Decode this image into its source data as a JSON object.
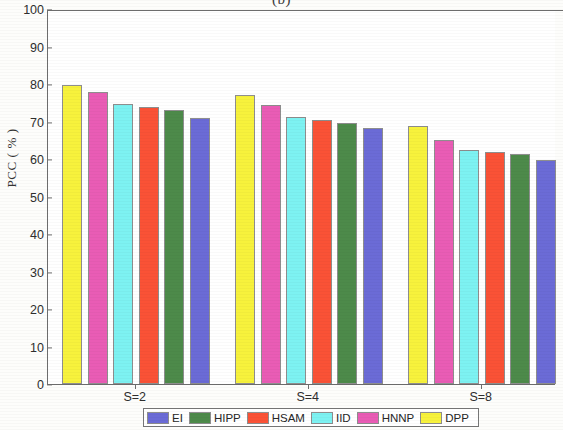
{
  "caption": "(b)",
  "chart_data": {
    "type": "bar",
    "title": "(b)",
    "xlabel": "",
    "ylabel": "PCC ( % )",
    "categories": [
      "S=2",
      "S=4",
      "S=8"
    ],
    "ylim": [
      0,
      100
    ],
    "ytick_step": 10,
    "yticks": [
      "100",
      "90",
      "80",
      "70",
      "60",
      "50",
      "40",
      "30",
      "20",
      "10",
      "0"
    ],
    "grid": false,
    "legend_position": "bottom-outside",
    "legend_order": [
      "EI",
      "HIPP",
      "HSAM",
      "IID",
      "HNNP",
      "DPP"
    ],
    "bar_draw_order": [
      "DPP",
      "HNNP",
      "IID",
      "HSAM",
      "HIPP",
      "EI"
    ],
    "series": [
      {
        "name": "DPP",
        "color": "#f7f23c",
        "values": [
          79.8,
          77.0,
          68.7
        ]
      },
      {
        "name": "HNNP",
        "color": "#e95cb5",
        "values": [
          78.0,
          74.4,
          65.0
        ]
      },
      {
        "name": "IID",
        "color": "#7df2f2",
        "values": [
          74.7,
          71.2,
          62.4
        ]
      },
      {
        "name": "HSAM",
        "color": "#fa5236",
        "values": [
          73.8,
          70.4,
          62.0
        ]
      },
      {
        "name": "HIPP",
        "color": "#4d8a4a",
        "values": [
          73.2,
          69.7,
          61.3
        ]
      },
      {
        "name": "EI",
        "color": "#6b6bd6",
        "values": [
          71.0,
          68.2,
          59.8
        ]
      }
    ],
    "colors": {
      "EI": "#6b6bd6",
      "HIPP": "#4d8a4a",
      "HSAM": "#fa5236",
      "IID": "#7df2f2",
      "HNNP": "#e95cb5",
      "DPP": "#f7f23c",
      "axis": "#6d6d6d",
      "text": "#2e2e2e",
      "background": "#ffffff"
    }
  }
}
